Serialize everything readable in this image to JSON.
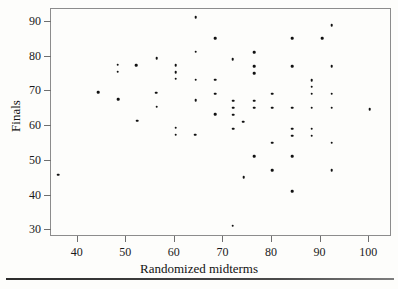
{
  "figure": {
    "x_axis_title": "Randomized midterms",
    "y_axis_title": "Finals"
  },
  "chart_data": {
    "type": "scatter",
    "title": "",
    "xlabel": "Randomized midterms",
    "ylabel": "Finals",
    "xlim": [
      34.5,
      104.7
    ],
    "ylim": [
      28.1,
      93.7
    ],
    "xticks": [
      40,
      50,
      60,
      70,
      80,
      90,
      100
    ],
    "yticks": [
      30,
      40,
      50,
      60,
      70,
      80,
      90
    ],
    "grid": false,
    "legend": null,
    "marker": "filled-circle",
    "marker_color": "#111111",
    "points": [
      [
        36.2,
        45.7
      ],
      [
        44.4,
        69.4
      ],
      [
        48.4,
        77.4
      ],
      [
        48.4,
        75.4
      ],
      [
        48.6,
        67.4
      ],
      [
        52.3,
        77.3
      ],
      [
        52.4,
        61.3
      ],
      [
        56.5,
        79.3
      ],
      [
        56.4,
        69.3
      ],
      [
        56.5,
        65.3
      ],
      [
        60.4,
        77.2
      ],
      [
        60.4,
        75.2
      ],
      [
        60.4,
        73.3
      ],
      [
        60.4,
        59.3
      ],
      [
        60.4,
        57.3
      ],
      [
        64.5,
        91.1
      ],
      [
        64.5,
        81.1
      ],
      [
        64.5,
        73.1
      ],
      [
        64.5,
        67.2
      ],
      [
        64.4,
        57.3
      ],
      [
        68.5,
        85.0
      ],
      [
        68.5,
        73.1
      ],
      [
        68.5,
        69.1
      ],
      [
        68.5,
        63.1
      ],
      [
        72.1,
        79.0
      ],
      [
        72.2,
        67.0
      ],
      [
        72.2,
        65.0
      ],
      [
        72.2,
        63.0
      ],
      [
        72.2,
        59.0
      ],
      [
        72.1,
        31.1
      ],
      [
        74.3,
        61.0
      ],
      [
        74.4,
        45.1
      ],
      [
        76.5,
        81.0
      ],
      [
        76.5,
        77.0
      ],
      [
        76.5,
        75.0
      ],
      [
        76.5,
        67.0
      ],
      [
        76.5,
        65.0
      ],
      [
        76.5,
        51.0
      ],
      [
        80.3,
        69.0
      ],
      [
        80.3,
        65.0
      ],
      [
        80.3,
        55.0
      ],
      [
        80.3,
        47.0
      ],
      [
        84.4,
        85.0
      ],
      [
        84.4,
        77.0
      ],
      [
        84.4,
        65.0
      ],
      [
        84.4,
        59.0
      ],
      [
        84.4,
        57.0
      ],
      [
        84.4,
        51.0
      ],
      [
        84.4,
        41.0
      ],
      [
        88.4,
        73.0
      ],
      [
        88.4,
        71.0
      ],
      [
        88.4,
        69.0
      ],
      [
        88.4,
        65.0
      ],
      [
        88.4,
        59.0
      ],
      [
        88.4,
        57.0
      ],
      [
        90.5,
        85.0
      ],
      [
        92.5,
        88.8
      ],
      [
        92.5,
        77.0
      ],
      [
        92.5,
        69.0
      ],
      [
        92.5,
        65.0
      ],
      [
        92.5,
        55.0
      ],
      [
        92.5,
        47.0
      ],
      [
        100.3,
        64.6
      ]
    ]
  }
}
